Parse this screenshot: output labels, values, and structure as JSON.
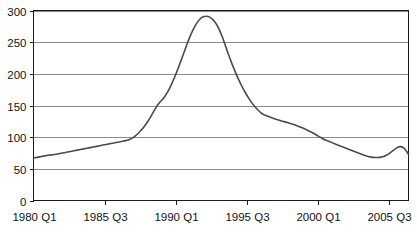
{
  "chart_data": {
    "type": "line",
    "title": "",
    "subtitle": "",
    "xlabel": "",
    "ylabel": "",
    "ylim": [
      0,
      300
    ],
    "ytick_values": [
      0,
      50,
      100,
      150,
      200,
      250,
      300
    ],
    "ytick_labels": [
      "0",
      "50",
      "100",
      "150",
      "200",
      "250",
      "300"
    ],
    "grid": true,
    "legend": false,
    "legend_position": "none",
    "xtick_labels": [
      "1980 Q1",
      "1985 Q3",
      "1990 Q1",
      "1995 Q3",
      "2000 Q1",
      "2005 Q3"
    ],
    "xtick_indices": [
      0,
      22,
      44,
      66,
      88,
      110
    ],
    "x_index_range": [
      0,
      116
    ],
    "series": [
      {
        "name": "series-1",
        "color": "#4a4a4a",
        "x": [
          0,
          1,
          2,
          3,
          4,
          5,
          6,
          7,
          8,
          9,
          10,
          11,
          12,
          13,
          14,
          15,
          16,
          17,
          18,
          19,
          20,
          21,
          22,
          23,
          24,
          25,
          26,
          27,
          28,
          29,
          30,
          31,
          32,
          33,
          34,
          35,
          36,
          37,
          38,
          39,
          40,
          41,
          42,
          43,
          44,
          45,
          46,
          47,
          48,
          49,
          50,
          51,
          52,
          53,
          54,
          55,
          56,
          57,
          58,
          59,
          60,
          61,
          62,
          63,
          64,
          65,
          66,
          67,
          68,
          69,
          70,
          71,
          72,
          73,
          74,
          75,
          76,
          77,
          78,
          79,
          80,
          81,
          82,
          83,
          84,
          85,
          86,
          87,
          88,
          89,
          90,
          91,
          92,
          93,
          94,
          95,
          96,
          97,
          98,
          99,
          100,
          101,
          102,
          103,
          104,
          105,
          106,
          107,
          108,
          109,
          110,
          111,
          112,
          113,
          114,
          115,
          116
        ],
        "values": [
          67,
          68,
          69,
          70,
          71,
          72,
          72,
          73,
          74,
          75,
          76,
          77,
          78,
          79,
          80,
          81,
          82,
          83,
          84,
          85,
          86,
          87,
          88,
          89,
          90,
          91,
          92,
          93,
          94,
          95,
          97,
          100,
          104,
          109,
          115,
          122,
          130,
          139,
          148,
          155,
          160,
          167,
          176,
          187,
          199,
          212,
          226,
          240,
          254,
          266,
          276,
          284,
          289,
          291,
          291,
          288,
          283,
          275,
          264,
          250,
          235,
          221,
          208,
          196,
          185,
          175,
          166,
          158,
          151,
          145,
          140,
          136,
          134,
          132,
          130,
          128,
          127,
          125,
          124,
          122,
          121,
          119,
          117,
          115,
          113,
          110,
          108,
          105,
          102,
          99,
          96,
          94,
          92,
          90,
          88,
          86,
          84,
          82,
          80,
          78,
          76,
          74,
          72,
          70,
          69,
          68,
          68,
          68,
          69,
          71,
          74,
          78,
          82,
          85,
          85,
          81,
          73
        ],
        "value_range": [
          67,
          291
        ],
        "peak_value": 291,
        "peak_x_label": "1990 Q4",
        "start_value": 67,
        "end_value": 73
      }
    ]
  },
  "figure": {
    "background_color": "#ffffff",
    "plot_border_color": "#1a1a1a",
    "gridline_color": "#8a8a8a",
    "tick_label_color": "#111111"
  }
}
